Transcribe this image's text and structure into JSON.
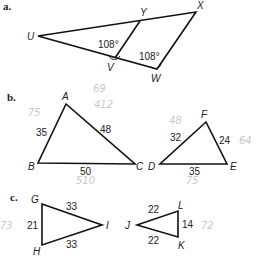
{
  "parts": {
    "a": {
      "label": "a.",
      "vertices": {
        "U": "U",
        "V": "V",
        "W": "W",
        "X": "X",
        "Y": "Y"
      },
      "angles": {
        "v": "108°",
        "w": "108°"
      }
    },
    "b": {
      "label": "b.",
      "triangle1": {
        "vertices": {
          "A": "A",
          "B": "B",
          "C": "C"
        },
        "sides": {
          "AB": "35",
          "AC": "48",
          "BC": "50"
        }
      },
      "triangle2": {
        "vertices": {
          "D": "D",
          "E": "E",
          "F": "F"
        },
        "sides": {
          "DF": "32",
          "FE": "24",
          "DE": "35"
        }
      },
      "handwritten": [
        "75",
        "69",
        "412",
        "510",
        "48",
        "64",
        "75"
      ]
    },
    "c": {
      "label": "c.",
      "triangle1": {
        "vertices": {
          "G": "G",
          "H": "H",
          "I": "I"
        },
        "sides": {
          "GI": "33",
          "GH": "21",
          "HI": "33"
        }
      },
      "triangle2": {
        "vertices": {
          "J": "J",
          "K": "K",
          "L": "L"
        },
        "sides": {
          "JL": "22",
          "LK": "14",
          "JK": "22"
        }
      },
      "handwritten": [
        "73",
        "72"
      ]
    }
  }
}
